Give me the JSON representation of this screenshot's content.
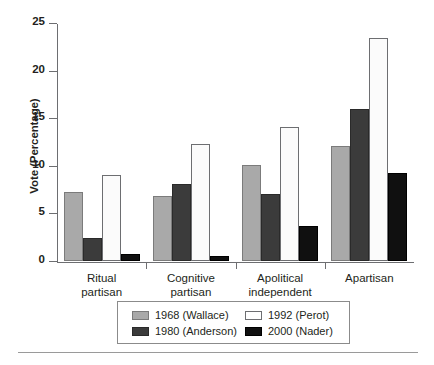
{
  "chart_data": {
    "type": "bar",
    "title": "",
    "subtitle": "",
    "xlabel": "",
    "ylabel": "Vote (Percentage)",
    "ylim": [
      0,
      25
    ],
    "yticks": [
      0,
      5,
      10,
      15,
      20,
      25
    ],
    "ytick_labels": [
      "0",
      "5",
      "10",
      "15",
      "20",
      "25"
    ],
    "grid": false,
    "legend_position": "bottom",
    "categories": [
      "Ritual\npartisan",
      "Cognitive\npartisan",
      "Apolitical\nindependent",
      "Apartisan"
    ],
    "category_lines": [
      [
        "Ritual",
        "partisan"
      ],
      [
        "Cognitive",
        "partisan"
      ],
      [
        "Apolitical",
        "independent"
      ],
      [
        "Apartisan"
      ]
    ],
    "series": [
      {
        "name": "1968 (Wallace)",
        "color": "#a9a9a9",
        "values": [
          7.2,
          6.8,
          10.1,
          12.1
        ]
      },
      {
        "name": "1980 (Anderson)",
        "color": "#3b3b3b",
        "values": [
          2.4,
          8.1,
          7.0,
          16.0
        ]
      },
      {
        "name": "1992 (Perot)",
        "color": "#ffffff",
        "values": [
          9.0,
          12.3,
          14.1,
          23.4
        ]
      },
      {
        "name": "2000 (Nader)",
        "color": "#101010",
        "values": [
          0.7,
          0.5,
          3.7,
          9.2
        ]
      }
    ],
    "legend_entries": [
      {
        "label": "1968 (Wallace)",
        "swatch": "s0"
      },
      {
        "label": "1980 (Anderson)",
        "swatch": "s1"
      },
      {
        "label": "1992 (Perot)",
        "swatch": "s2"
      },
      {
        "label": "2000 (Nader)",
        "swatch": "s3"
      }
    ]
  }
}
